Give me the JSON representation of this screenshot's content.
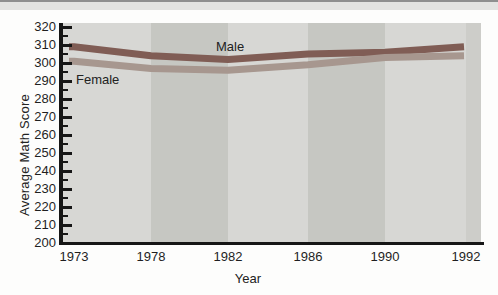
{
  "chart_data": {
    "type": "line",
    "title": "",
    "xlabel": "Year",
    "ylabel": "Average Math Score",
    "categories": [
      "1973",
      "1978",
      "1982",
      "1986",
      "1990",
      "1992"
    ],
    "series": [
      {
        "name": "Male",
        "values": [
          309,
          304,
          302,
          305,
          306,
          309
        ],
        "color": "#805d55"
      },
      {
        "name": "Female",
        "values": [
          301,
          297,
          296,
          299,
          303,
          304
        ],
        "color": "#a7978f"
      }
    ],
    "ylim": [
      200,
      320
    ],
    "ytick_step": 10,
    "ytick_minor_step": 5,
    "grid": false,
    "legend_position": "inline-annotations",
    "annotations": [
      {
        "text": "Male"
      },
      {
        "text": "Female"
      }
    ],
    "background_bands": {
      "light_color": "#d7d7d4",
      "dark_color": "#c6c7c2",
      "right_strip_color": "#cdcdc9"
    },
    "axis_color": "#161616"
  }
}
